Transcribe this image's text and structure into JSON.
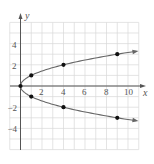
{
  "chart_data": {
    "type": "line",
    "title": "",
    "xlabel": "x",
    "ylabel": "y",
    "xlim": [
      -1,
      11
    ],
    "ylim": [
      -6,
      6
    ],
    "grid": true,
    "x_ticks": [
      "2",
      "4",
      "6",
      "8",
      "10"
    ],
    "y_ticks": [
      "4",
      "2",
      "−2",
      "−4"
    ],
    "series": [
      {
        "name": "upper branch",
        "equation": "y = sqrt(x)",
        "points": [
          [
            0,
            0
          ],
          [
            1,
            1
          ],
          [
            4,
            2
          ],
          [
            9,
            3
          ]
        ]
      },
      {
        "name": "lower branch",
        "equation": "y = -sqrt(x)",
        "points": [
          [
            0,
            0
          ],
          [
            1,
            -1
          ],
          [
            4,
            -2
          ],
          [
            9,
            -3
          ]
        ]
      }
    ],
    "colors": {
      "curve": "#666666",
      "grid": "#d8d8d8",
      "axis": "#555555",
      "point": "#111111"
    }
  }
}
